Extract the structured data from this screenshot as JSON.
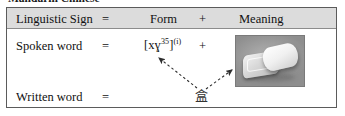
{
  "caption": {
    "text": "Mandarin Chinese"
  },
  "table": {
    "header": {
      "sign_label": "Linguistic Sign",
      "equals": "=",
      "form_label": "Form",
      "plus": "+",
      "meaning_label": "Meaning"
    },
    "rows": [
      {
        "label": "Spoken word",
        "equals": "=",
        "form": "[xɣ",
        "form_tone": "35",
        "form_close": "]",
        "form_note": "(i)",
        "plus": "+",
        "meaning_type": "photo",
        "meaning_alt": "plastic-container-with-lid-photo"
      },
      {
        "label": "Written word",
        "equals": "=",
        "form": "盒",
        "meaning_type": "arrows"
      }
    ]
  },
  "annotations": {
    "arrow_to_form": "dashed-arrow-pointing-to-spoken-form",
    "arrow_to_meaning": "dashed-arrow-pointing-to-meaning-image"
  },
  "colors": {
    "header_background": "#dcdcdc",
    "border": "#5b5b5b",
    "text": "#111111",
    "arrow": "#3a3a3a",
    "photo_background": "#9d9d9d"
  }
}
